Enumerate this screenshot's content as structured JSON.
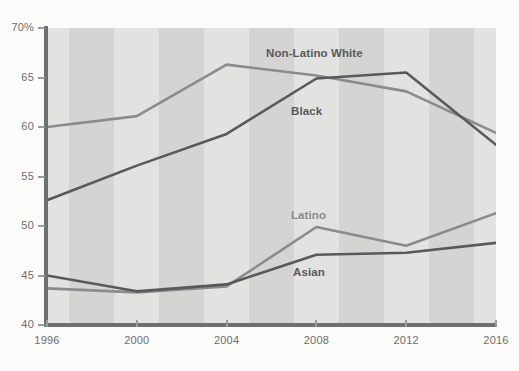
{
  "chart_data": {
    "type": "line",
    "title": "",
    "subtitle": "",
    "xlabel": "",
    "ylabel": "",
    "x": [
      1996,
      2000,
      2004,
      2008,
      2012,
      2016
    ],
    "xtick_labels": [
      "1996",
      "2000",
      "2004",
      "2008",
      "2012",
      "2016"
    ],
    "ytick_labels": [
      "40",
      "45",
      "50",
      "55",
      "60",
      "65",
      "70%"
    ],
    "ytick_values": [
      40,
      45,
      50,
      55,
      60,
      65,
      70
    ],
    "xlim": [
      1996,
      2016
    ],
    "ylim": [
      40,
      70
    ],
    "grid": false,
    "legend_position": "inline-labels",
    "background": "alternating vertical gray stripes",
    "series": [
      {
        "name": "Non-Latino White",
        "color": "#8a8b8d",
        "values": [
          60.0,
          61.1,
          66.3,
          65.2,
          63.6,
          59.4
        ]
      },
      {
        "name": "Black",
        "color": "#58595b",
        "values": [
          52.6,
          56.1,
          59.3,
          64.9,
          65.5,
          58.2
        ]
      },
      {
        "name": "Latino",
        "color": "#8a8b8d",
        "values": [
          43.7,
          43.3,
          43.9,
          49.9,
          48.0,
          51.3
        ]
      },
      {
        "name": "Asian",
        "color": "#58595b",
        "values": [
          45.0,
          43.4,
          44.1,
          47.1,
          47.3,
          48.3
        ]
      }
    ],
    "annotations": [
      {
        "text": "Non-Latino White",
        "color": "#58595b",
        "x": 266,
        "y": 47
      },
      {
        "text": "Black",
        "color": "#58595b",
        "x": 291,
        "y": 105
      },
      {
        "text": "Latino",
        "color": "#8a8b8d",
        "x": 291,
        "y": 209
      },
      {
        "text": "Asian",
        "color": "#58595b",
        "x": 293,
        "y": 266
      }
    ],
    "colors": {
      "axis": "#6e6f71",
      "tick_text": "#6d6e70",
      "stripe_light": "#e2e2e1",
      "stripe_dark": "#d4d4d3",
      "page_background": "#fbfbfa"
    }
  }
}
